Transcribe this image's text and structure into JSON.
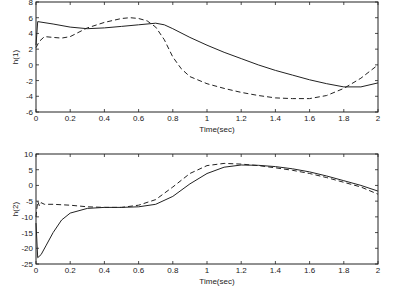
{
  "chart_data": [
    {
      "type": "line",
      "title": "",
      "xlabel": "Time(sec)",
      "ylabel": "h(1)",
      "xlim": [
        0,
        2
      ],
      "ylim": [
        -6,
        8
      ],
      "xticks": [
        "0",
        "0.2",
        "0.4",
        "0.6",
        "0.8",
        "1",
        "1.2",
        "1.4",
        "1.6",
        "1.8",
        "2"
      ],
      "yticks": [
        "-6",
        "-4",
        "-2",
        "0",
        "2",
        "4",
        "6",
        "8"
      ],
      "grid": false,
      "series": [
        {
          "name": "solid",
          "style": "solid",
          "x": [
            0,
            0.01,
            0.1,
            0.2,
            0.3,
            0.4,
            0.5,
            0.6,
            0.7,
            0.75,
            0.8,
            0.9,
            1.0,
            1.1,
            1.2,
            1.3,
            1.4,
            1.5,
            1.6,
            1.7,
            1.8,
            1.9,
            2.0
          ],
          "y": [
            2.5,
            5.5,
            5.2,
            4.8,
            4.6,
            4.7,
            4.9,
            5.1,
            5.3,
            5.1,
            4.6,
            3.5,
            2.5,
            1.6,
            0.8,
            0.0,
            -0.7,
            -1.3,
            -1.9,
            -2.4,
            -2.8,
            -2.8,
            -2.3
          ]
        },
        {
          "name": "dashed",
          "style": "dashed",
          "x": [
            0,
            0.02,
            0.05,
            0.1,
            0.15,
            0.2,
            0.3,
            0.4,
            0.5,
            0.55,
            0.6,
            0.65,
            0.7,
            0.75,
            0.8,
            0.85,
            0.9,
            1.0,
            1.1,
            1.2,
            1.3,
            1.4,
            1.5,
            1.6,
            1.7,
            1.8,
            1.9,
            2.0
          ],
          "y": [
            2.2,
            3.0,
            3.6,
            3.5,
            3.4,
            3.6,
            4.7,
            5.4,
            5.9,
            6.0,
            5.9,
            5.6,
            4.8,
            3.2,
            1.0,
            -0.5,
            -1.5,
            -2.4,
            -3.0,
            -3.5,
            -3.9,
            -4.2,
            -4.3,
            -4.3,
            -3.9,
            -3.0,
            -1.7,
            0.0
          ]
        }
      ]
    },
    {
      "type": "line",
      "title": "",
      "xlabel": "Time(sec)",
      "ylabel": "h(2)",
      "xlim": [
        0,
        2
      ],
      "ylim": [
        -25,
        10
      ],
      "xticks": [
        "0",
        "0.2",
        "0.4",
        "0.6",
        "0.8",
        "1",
        "1.2",
        "1.4",
        "1.6",
        "1.8",
        "2"
      ],
      "yticks": [
        "-25",
        "-20",
        "-15",
        "-10",
        "-5",
        "0",
        "5",
        "10"
      ],
      "grid": false,
      "series": [
        {
          "name": "solid",
          "style": "solid",
          "x": [
            0,
            0.01,
            0.03,
            0.06,
            0.1,
            0.15,
            0.2,
            0.3,
            0.4,
            0.5,
            0.6,
            0.7,
            0.8,
            0.9,
            1.0,
            1.1,
            1.2,
            1.3,
            1.4,
            1.5,
            1.6,
            1.7,
            1.8,
            1.9,
            2.0
          ],
          "y": [
            -12,
            -23,
            -22,
            -19,
            -15,
            -11,
            -8.8,
            -7.3,
            -7.0,
            -7.0,
            -6.8,
            -6.0,
            -3.5,
            0.5,
            3.8,
            5.8,
            6.5,
            6.4,
            6.0,
            5.3,
            4.3,
            3.0,
            1.5,
            0.0,
            -1.8
          ]
        },
        {
          "name": "dashed",
          "style": "dashed",
          "x": [
            0,
            0.01,
            0.02,
            0.03,
            0.05,
            0.1,
            0.2,
            0.3,
            0.4,
            0.5,
            0.6,
            0.7,
            0.8,
            0.9,
            1.0,
            1.1,
            1.2,
            1.3,
            1.4,
            1.5,
            1.6,
            1.7,
            1.8,
            1.9,
            2.0
          ],
          "y": [
            -10,
            -5,
            -6.5,
            -5.5,
            -6.0,
            -6.0,
            -6.3,
            -6.8,
            -7.0,
            -7.0,
            -6.3,
            -4.5,
            -0.5,
            3.8,
            6.3,
            7.0,
            6.8,
            6.3,
            5.6,
            4.8,
            3.8,
            2.5,
            1.0,
            -0.5,
            -2.8
          ]
        }
      ]
    }
  ]
}
